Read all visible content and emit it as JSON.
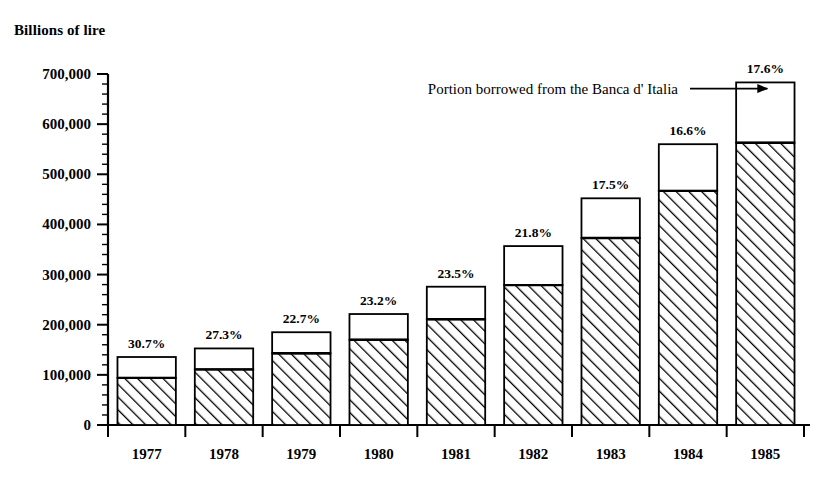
{
  "chart_data": {
    "type": "bar",
    "title": "",
    "ylabel": "Billions of lire",
    "xlabel": "",
    "ylim": [
      0,
      700000
    ],
    "ytick_step": 100000,
    "yminor_step": 20000,
    "grid": false,
    "legend_position": "none",
    "stacked": true,
    "categories": [
      "1977",
      "1978",
      "1979",
      "1980",
      "1981",
      "1982",
      "1983",
      "1984",
      "1985"
    ],
    "ytick_labels": [
      "0",
      "100,000",
      "200,000",
      "300,000",
      "400,000",
      "500,000",
      "600,000",
      "700,000"
    ],
    "ytick_values": [
      0,
      100000,
      200000,
      300000,
      400000,
      500000,
      600000,
      700000
    ],
    "series": [
      {
        "name": "Other borrowing",
        "pattern": "diagonal-hatch",
        "values": [
          94000,
          111000,
          143000,
          170000,
          211000,
          279000,
          373000,
          467000,
          563000
        ]
      },
      {
        "name": "Portion borrowed from the Banca d' Italia",
        "pattern": "white",
        "values": [
          41600,
          41700,
          42000,
          51300,
          64800,
          77800,
          79100,
          93000,
          120200
        ]
      }
    ],
    "totals": [
      135600,
      152700,
      185000,
      221300,
      275800,
      356800,
      452100,
      560000,
      683200
    ],
    "data_labels": [
      "30.7%",
      "27.3%",
      "22.7%",
      "23.2%",
      "23.5%",
      "21.8%",
      "17.5%",
      "16.6%",
      "17.6%"
    ],
    "annotations": [
      {
        "text": "Portion borrowed from the Banca d' Italia",
        "points_to": "1985",
        "arrow": true
      }
    ]
  }
}
